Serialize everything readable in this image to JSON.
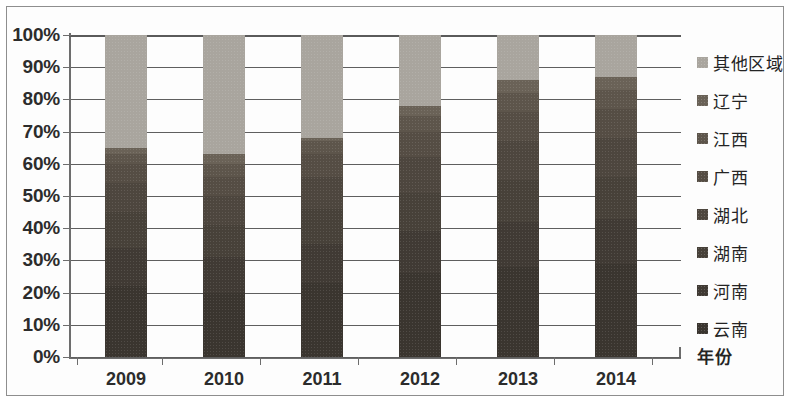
{
  "chart_data": {
    "type": "bar",
    "stacked": true,
    "stack_mode": "percent",
    "title": "",
    "subtitle": "",
    "xlabel": "年份",
    "ylabel": "",
    "categories": [
      "2009",
      "2010",
      "2011",
      "2012",
      "2013",
      "2014"
    ],
    "ylim": [
      0,
      100
    ],
    "ytick_labels": [
      "0%",
      "10%",
      "20%",
      "30%",
      "40%",
      "50%",
      "60%",
      "70%",
      "80%",
      "90%",
      "100%"
    ],
    "ytick_values": [
      0,
      10,
      20,
      30,
      40,
      50,
      60,
      70,
      80,
      90,
      100
    ],
    "grid": true,
    "legend_position": "right",
    "series": [
      {
        "name": "云南",
        "color": "#3a352f",
        "values": [
          22.0,
          20.0,
          23.0,
          26.0,
          28.0,
          29.0
        ]
      },
      {
        "name": "河南",
        "color": "#403a34",
        "values": [
          12.0,
          11.0,
          12.0,
          13.0,
          14.0,
          14.0
        ]
      },
      {
        "name": "湖南",
        "color": "#474139",
        "values": [
          11.0,
          10.0,
          11.0,
          12.0,
          13.0,
          13.0
        ]
      },
      {
        "name": "湖北",
        "color": "#4d463e",
        "values": [
          9.0,
          9.0,
          10.0,
          11.0,
          12.0,
          12.0
        ]
      },
      {
        "name": "广西",
        "color": "#554d44",
        "values": [
          6.0,
          6.0,
          7.0,
          8.0,
          9.0,
          9.0
        ]
      },
      {
        "name": "江西",
        "color": "#5d554b",
        "values": [
          3.0,
          4.0,
          4.0,
          5.0,
          6.0,
          6.0
        ]
      },
      {
        "name": "辽宁",
        "color": "#6a6257",
        "values": [
          2.0,
          3.0,
          1.0,
          3.0,
          4.0,
          4.0
        ]
      },
      {
        "name": "其他区域",
        "color": "#a9a59e",
        "values": [
          35.0,
          37.0,
          32.0,
          22.0,
          14.0,
          13.0
        ]
      }
    ],
    "legend_order_top_to_bottom": [
      "其他区域",
      "辽宁",
      "江西",
      "广西",
      "湖北",
      "湖南",
      "河南",
      "云南"
    ]
  }
}
